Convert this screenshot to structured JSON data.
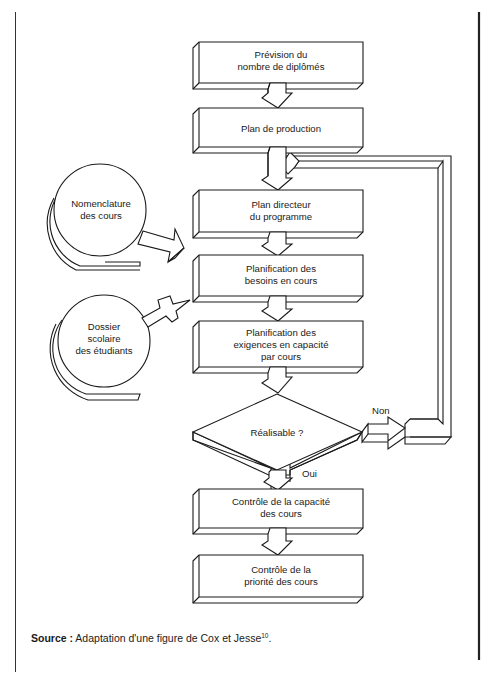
{
  "figure": {
    "process_boxes": [
      {
        "id": "prevision",
        "lines": [
          "Prévision du",
          "nombre de diplômés"
        ]
      },
      {
        "id": "plan-production",
        "lines": [
          "Plan de production"
        ]
      },
      {
        "id": "plan-directeur",
        "lines": [
          "Plan directeur",
          "du programme"
        ]
      },
      {
        "id": "planif-besoins",
        "lines": [
          "Planification des",
          "besoins en cours"
        ]
      },
      {
        "id": "planif-exigences",
        "lines": [
          "Planification des",
          "exigences en capacité",
          "par cours"
        ]
      },
      {
        "id": "controle-capacite",
        "lines": [
          "Contrôle de la capacité",
          "des cours"
        ]
      },
      {
        "id": "controle-priorite",
        "lines": [
          "Contrôle de la",
          "priorité des cours"
        ]
      }
    ],
    "decision": {
      "label": "Réalisable ?",
      "yes_label": "Oui",
      "no_label": "Non"
    },
    "data_stores": [
      {
        "id": "nomenclature",
        "lines": [
          "Nomenclature",
          "des cours"
        ]
      },
      {
        "id": "dossier",
        "lines": [
          "Dossier",
          "scolaire",
          "des étudiants"
        ]
      }
    ]
  },
  "caption": {
    "source_label": "Source :",
    "source_text": " Adaptation d'une figure de Cox et Jesse",
    "footnote_ref": "10",
    "end": "."
  }
}
